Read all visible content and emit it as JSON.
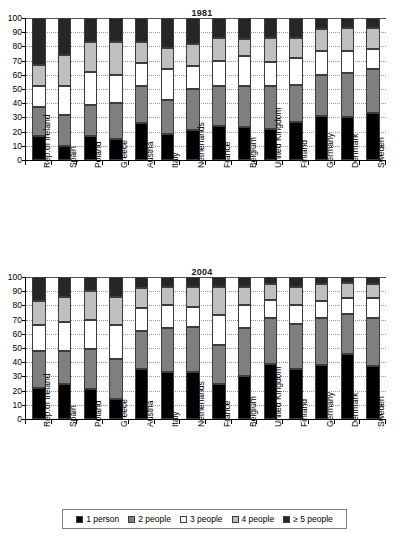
{
  "figure": {
    "background": "#ffffff",
    "width": 404,
    "height": 550
  },
  "legend": {
    "position": "bottom-center",
    "border_color": "#808080",
    "entries": [
      {
        "label": "1 person",
        "color": "#000000"
      },
      {
        "label": "2 people",
        "color": "#7f7f7f"
      },
      {
        "label": "3 people",
        "color": "#ffffff"
      },
      {
        "label": "4 people",
        "color": "#bfbfbf"
      },
      {
        "label": "≥ 5 people",
        "color": "#262626"
      }
    ]
  },
  "chart_data": [
    {
      "type": "bar",
      "subtype": "stacked-vertical-100pct",
      "title": "1981",
      "xlabel": "",
      "ylabel": "",
      "ylim": [
        0,
        100
      ],
      "yticks": [
        0,
        10,
        20,
        30,
        40,
        50,
        60,
        70,
        80,
        90,
        100
      ],
      "grid": true,
      "grid_axis": "y",
      "legend": "shared-bottom",
      "categories": [
        "Rep.of Ireland",
        "Spain",
        "Poland",
        "Greece",
        "Austria",
        "Italy",
        "Netherlands",
        "France",
        "Belgium",
        "United Kingdom",
        "Finland",
        "Germany",
        "Denmark",
        "Sweden"
      ],
      "series": [
        {
          "name": "1 person",
          "color": "#000000",
          "values": [
            17,
            10,
            17,
            15,
            26,
            18,
            21,
            24,
            23,
            22,
            27,
            31,
            30,
            33
          ]
        },
        {
          "name": "2 people",
          "color": "#7f7f7f",
          "values": [
            20,
            22,
            22,
            25,
            26,
            24,
            29,
            28,
            29,
            30,
            26,
            29,
            31,
            31
          ]
        },
        {
          "name": "3 people",
          "color": "#ffffff",
          "values": [
            15,
            20,
            23,
            20,
            16,
            22,
            16,
            18,
            21,
            17,
            19,
            17,
            16,
            14
          ]
        },
        {
          "name": "4 people",
          "color": "#bfbfbf",
          "values": [
            15,
            22,
            21,
            23,
            15,
            15,
            16,
            16,
            12,
            17,
            14,
            15,
            16,
            15
          ]
        },
        {
          "name": "≥ 5 people",
          "color": "#262626",
          "values": [
            33,
            26,
            17,
            17,
            17,
            21,
            18,
            14,
            15,
            14,
            14,
            8,
            7,
            7
          ]
        }
      ]
    },
    {
      "type": "bar",
      "subtype": "stacked-vertical-100pct",
      "title": "2004",
      "xlabel": "",
      "ylabel": "",
      "ylim": [
        0,
        100
      ],
      "yticks": [
        0,
        10,
        20,
        30,
        40,
        50,
        60,
        70,
        80,
        90,
        100
      ],
      "grid": true,
      "grid_axis": "y",
      "legend": "shared-bottom",
      "categories": [
        "Rep.of Ireland",
        "Spain",
        "Poland",
        "Greece",
        "Austria",
        "Italy",
        "Netherlands",
        "France",
        "Belgium",
        "United Kingdom",
        "Finland",
        "Germany",
        "Denmark",
        "Sweden"
      ],
      "series": [
        {
          "name": "1 person",
          "color": "#000000",
          "values": [
            22,
            25,
            21,
            14,
            35,
            33,
            33,
            25,
            30,
            39,
            35,
            38,
            46,
            37
          ]
        },
        {
          "name": "2 people",
          "color": "#7f7f7f",
          "values": [
            26,
            23,
            28,
            28,
            27,
            31,
            32,
            27,
            34,
            32,
            32,
            33,
            28,
            34
          ]
        },
        {
          "name": "3 people",
          "color": "#ffffff",
          "values": [
            18,
            20,
            21,
            24,
            16,
            16,
            14,
            21,
            16,
            13,
            13,
            12,
            11,
            14
          ]
        },
        {
          "name": "4 people",
          "color": "#bfbfbf",
          "values": [
            17,
            18,
            20,
            20,
            14,
            13,
            14,
            20,
            13,
            11,
            13,
            12,
            11,
            10
          ]
        },
        {
          "name": "≥ 5 people",
          "color": "#262626",
          "values": [
            17,
            14,
            10,
            14,
            8,
            7,
            7,
            7,
            7,
            5,
            7,
            5,
            4,
            5
          ]
        }
      ]
    }
  ]
}
